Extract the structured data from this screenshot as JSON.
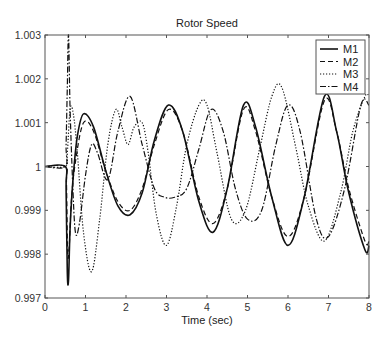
{
  "chart_data": {
    "type": "line",
    "title": "Rotor Speed",
    "xlabel": "Time (sec)",
    "ylabel": "",
    "xlim": [
      0,
      8
    ],
    "ylim": [
      0.997,
      1.003
    ],
    "xticks": [
      0,
      1,
      2,
      3,
      4,
      5,
      6,
      7,
      8
    ],
    "yticks": [
      0.997,
      0.998,
      0.999,
      1,
      1.001,
      1.002,
      1.003
    ],
    "ytick_labels": [
      "0.997",
      "0.998",
      "0.999",
      "1",
      "1.001",
      "1.002",
      "1.003"
    ],
    "grid": false,
    "legend_position": "upper right",
    "series": [
      {
        "name": "M1",
        "style": "solid",
        "x": [
          0,
          0.5,
          0.52,
          0.55,
          0.58,
          0.62,
          0.7,
          0.8,
          0.95,
          1.2,
          1.5,
          1.8,
          2.1,
          2.4,
          2.7,
          3.05,
          3.4,
          3.8,
          4.15,
          4.5,
          4.9,
          5.2,
          5.6,
          6.0,
          6.4,
          6.9,
          7.2,
          7.5,
          7.9,
          8.0
        ],
        "values": [
          1.0,
          1.0,
          0.9995,
          0.9976,
          0.9974,
          0.9986,
          0.9998,
          1.0007,
          1.0012,
          1.0009,
          0.9999,
          0.9991,
          0.9989,
          0.9994,
          1.0006,
          1.0014,
          1.0008,
          0.9992,
          0.9985,
          0.9995,
          1.0014,
          1.0009,
          0.9993,
          0.9982,
          0.9993,
          1.0016,
          1.0008,
          0.9994,
          0.9981,
          0.9982
        ]
      },
      {
        "name": "M2",
        "style": "dashed",
        "x": [
          0,
          0.5,
          0.53,
          0.56,
          0.6,
          0.65,
          0.75,
          0.95,
          1.2,
          1.5,
          1.8,
          2.1,
          2.4,
          2.7,
          3.05,
          3.4,
          3.8,
          4.15,
          4.5,
          4.9,
          5.2,
          5.6,
          6.0,
          6.4,
          6.9,
          7.2,
          7.5,
          7.9,
          8.0
        ],
        "values": [
          1.0,
          1.0,
          0.9996,
          0.998,
          0.9982,
          0.9992,
          1.0001,
          1.001,
          1.0008,
          0.9999,
          0.9992,
          0.999,
          0.9995,
          1.0005,
          1.0013,
          1.0008,
          0.9993,
          0.9987,
          0.9995,
          1.0013,
          1.0008,
          0.9993,
          0.9984,
          0.9993,
          1.0015,
          1.0008,
          0.9995,
          0.9983,
          0.9983
        ]
      },
      {
        "name": "M3",
        "style": "dotted",
        "x": [
          0,
          0.5,
          0.55,
          0.62,
          0.7,
          0.8,
          0.95,
          1.15,
          1.35,
          1.55,
          1.75,
          1.9,
          2.05,
          2.2,
          2.4,
          2.55,
          2.75,
          3.0,
          3.25,
          3.5,
          3.8,
          4.0,
          4.25,
          4.6,
          4.95,
          5.3,
          5.6,
          5.85,
          6.2,
          6.5,
          6.9,
          7.3,
          7.6,
          7.9,
          8.0
        ],
        "values": [
          1.0,
          1.0,
          1.0003,
          1.0013,
          1.0012,
          1.0003,
          0.9985,
          0.9976,
          0.9988,
          1.0005,
          1.0013,
          1.0009,
          1.0005,
          1.0009,
          1.001,
          1.0003,
          0.9989,
          0.9982,
          0.9991,
          1.0005,
          1.0014,
          1.0014,
          1.0003,
          0.9988,
          0.999,
          1.0004,
          1.0016,
          1.0018,
          1.0004,
          0.9991,
          0.9983,
          0.9994,
          1.0008,
          1.0016,
          1.0016
        ]
      },
      {
        "name": "M4",
        "style": "dashdot",
        "x": [
          0,
          0.5,
          0.52,
          0.55,
          0.58,
          0.62,
          0.68,
          0.75,
          0.85,
          1.0,
          1.15,
          1.3,
          1.55,
          1.8,
          2.1,
          2.4,
          2.7,
          2.95,
          3.2,
          3.5,
          3.8,
          4.1,
          4.4,
          4.7,
          5.0,
          5.35,
          5.7,
          6.0,
          6.3,
          6.7,
          7.0,
          7.4,
          7.8,
          8.0
        ],
        "values": [
          1.0,
          1.0,
          1.0005,
          1.0018,
          1.003,
          1.0013,
          0.9997,
          0.9985,
          0.9987,
          0.9998,
          1.0005,
          1.0003,
          0.9997,
          1.0008,
          1.0016,
          1.0005,
          0.9995,
          0.9993,
          0.9993,
          0.9995,
          1.0004,
          1.0013,
          1.0008,
          0.9995,
          0.9988,
          0.999,
          1.0005,
          1.0014,
          1.0008,
          0.9988,
          0.9984,
          0.9995,
          1.0014,
          1.0014
        ]
      }
    ]
  },
  "legend": {
    "items": [
      {
        "label": "M1",
        "style": "solid"
      },
      {
        "label": "M2",
        "style": "dashed"
      },
      {
        "label": "M3",
        "style": "dotted"
      },
      {
        "label": "M4",
        "style": "dashdot"
      }
    ]
  },
  "colors": {
    "axis": "#555555",
    "line": "#111111",
    "background": "#ffffff"
  }
}
